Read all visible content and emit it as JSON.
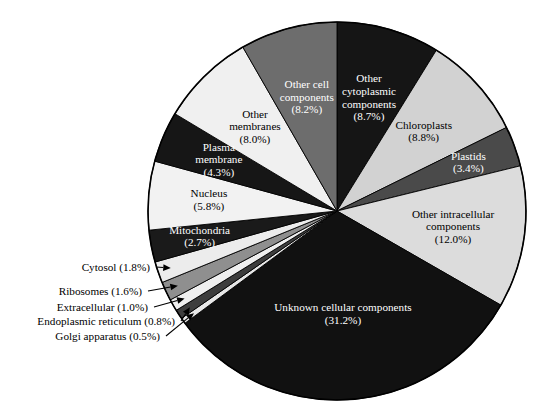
{
  "chart_data": {
    "type": "pie",
    "title": "",
    "subtitle": "",
    "xlabel": "",
    "ylabel": "",
    "legend_position": "none",
    "grid": false,
    "units": "percent",
    "total": 100.0,
    "start_angle_deg": 0,
    "direction": "clockwise",
    "categories": [
      "Other cytoplasmic components",
      "Chloroplasts",
      "Plastids",
      "Other intracellular components",
      "Unknown cellular components",
      "Golgi apparatus",
      "Endoplasmic reticulum",
      "Extracellular",
      "Ribosomes",
      "Cytosol",
      "Mitochondria",
      "Nucleus",
      "Plasma membrane",
      "Other membranes",
      "Other cell components"
    ],
    "values": [
      8.7,
      8.8,
      3.4,
      12.0,
      31.2,
      0.5,
      0.8,
      1.0,
      1.6,
      1.8,
      2.7,
      5.8,
      4.3,
      8.0,
      8.2
    ],
    "slices": [
      {
        "label": "Other cytoplasmic components",
        "value": 8.7,
        "value_text": "(8.7%)",
        "label_lines": [
          "Other",
          "cytoplasmic",
          "components"
        ],
        "color": "#151515",
        "text_color": "#ffffff",
        "callout": false
      },
      {
        "label": "Chloroplasts",
        "value": 8.8,
        "value_text": "(8.8%)",
        "label_lines": [
          "Chloroplasts"
        ],
        "color": "#d2d2d2",
        "text_color": "#000000",
        "callout": false
      },
      {
        "label": "Plastids",
        "value": 3.4,
        "value_text": "(3.4%)",
        "label_lines": [
          "Plastids"
        ],
        "color": "#4a4a4a",
        "text_color": "#ffffff",
        "callout": false
      },
      {
        "label": "Other intracellular components",
        "value": 12.0,
        "value_text": "(12.0%)",
        "label_lines": [
          "Other intracellular",
          "components"
        ],
        "color": "#dcdcdc",
        "text_color": "#000000",
        "callout": false
      },
      {
        "label": "Unknown cellular components",
        "value": 31.2,
        "value_text": "(31.2%)",
        "label_lines": [
          "Unknown cellular components"
        ],
        "color": "#111111",
        "text_color": "#ffffff",
        "callout": false
      },
      {
        "label": "Golgi apparatus",
        "value": 0.5,
        "value_text": "(0.5%)",
        "label_lines": [
          "Golgi apparatus"
        ],
        "color": "#e8e8e8",
        "text_color": "#000000",
        "callout": true
      },
      {
        "label": "Endoplasmic reticulum",
        "value": 0.8,
        "value_text": "(0.8%)",
        "label_lines": [
          "Endoplasmic reticulum"
        ],
        "color": "#3d3d3d",
        "text_color": "#ffffff",
        "callout": true
      },
      {
        "label": "Extracellular",
        "value": 1.0,
        "value_text": "(1.0%)",
        "label_lines": [
          "Extracellular"
        ],
        "color": "#efefef",
        "text_color": "#000000",
        "callout": true
      },
      {
        "label": "Ribosomes",
        "value": 1.6,
        "value_text": "(1.6%)",
        "label_lines": [
          "Ribosomes"
        ],
        "color": "#8f8f8f",
        "text_color": "#000000",
        "callout": true
      },
      {
        "label": "Cytosol",
        "value": 1.8,
        "value_text": "(1.8%)",
        "label_lines": [
          "Cytosol"
        ],
        "color": "#ececec",
        "text_color": "#000000",
        "callout": true
      },
      {
        "label": "Mitochondria",
        "value": 2.7,
        "value_text": "(2.7%)",
        "label_lines": [
          "Mitochondria"
        ],
        "color": "#1a1a1a",
        "text_color": "#ffffff",
        "callout": false
      },
      {
        "label": "Nucleus",
        "value": 5.8,
        "value_text": "(5.8%)",
        "label_lines": [
          "Nucleus"
        ],
        "color": "#f2f2f2",
        "text_color": "#000000",
        "callout": false
      },
      {
        "label": "Plasma membrane",
        "value": 4.3,
        "value_text": "(4.3%)",
        "label_lines": [
          "Plasma",
          "membrane"
        ],
        "color": "#161616",
        "text_color": "#ffffff",
        "callout": false
      },
      {
        "label": "Other membranes",
        "value": 8.0,
        "value_text": "(8.0%)",
        "label_lines": [
          "Other",
          "membranes"
        ],
        "color": "#f0f0f0",
        "text_color": "#000000",
        "callout": false
      },
      {
        "label": "Other cell components",
        "value": 8.2,
        "value_text": "(8.2%)",
        "label_lines": [
          "Other cell",
          "components"
        ],
        "color": "#6d6d6d",
        "text_color": "#ffffff",
        "callout": false
      }
    ],
    "callout_labels": [
      {
        "text": "Cytosol (1.8%)"
      },
      {
        "text": "Ribosomes (1.6%)"
      },
      {
        "text": "Extracellular (1.0%)"
      },
      {
        "text": "Endoplasmic reticulum (0.8%)"
      },
      {
        "text": "Golgi apparatus (0.5%)"
      }
    ]
  },
  "figure": {
    "background_color": "#ffffff",
    "outline_color": "#000000",
    "center_x": 337,
    "center_y": 211,
    "radius": 189
  }
}
